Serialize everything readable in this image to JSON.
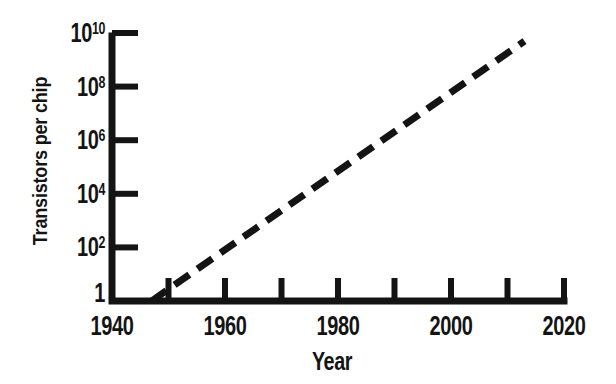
{
  "figure": {
    "background_color": "#ffffff",
    "ink_color": "#141414"
  },
  "chart_data": {
    "type": "line",
    "title": "",
    "xlabel": "Year",
    "ylabel": "Transistors per chip",
    "grid": false,
    "legend": "none",
    "x_axis": {
      "min": 1940,
      "max": 2020,
      "tick_interval": 10,
      "tick_mark_years": [
        1950,
        1960,
        1970,
        1980,
        1990,
        2000,
        2010,
        2020
      ],
      "labeled_ticks": [
        {
          "value": 1940,
          "label": "1940"
        },
        {
          "value": 1960,
          "label": "1960"
        },
        {
          "value": 1980,
          "label": "1980"
        },
        {
          "value": 2000,
          "label": "2000"
        },
        {
          "value": 2020,
          "label": "2020"
        }
      ]
    },
    "y_axis": {
      "scale": "log",
      "min": 1,
      "max": 10000000000,
      "tick_mark_exponents": [
        2,
        4,
        6,
        8,
        10
      ],
      "labeled_ticks": [
        {
          "exponent": 0,
          "base": "1",
          "sup": ""
        },
        {
          "exponent": 2,
          "base": "10",
          "sup": "2"
        },
        {
          "exponent": 4,
          "base": "10",
          "sup": "4"
        },
        {
          "exponent": 6,
          "base": "10",
          "sup": "6"
        },
        {
          "exponent": 8,
          "base": "10",
          "sup": "8"
        },
        {
          "exponent": 10,
          "base": "10",
          "sup": "10"
        }
      ]
    },
    "series": [
      {
        "name": "transistors-per-chip-trend",
        "style": "dashed",
        "color": "#141414",
        "stroke_width": 7,
        "points": [
          {
            "year": 1947,
            "value": 1
          },
          {
            "year": 2013,
            "value": 5000000000
          }
        ]
      }
    ]
  }
}
